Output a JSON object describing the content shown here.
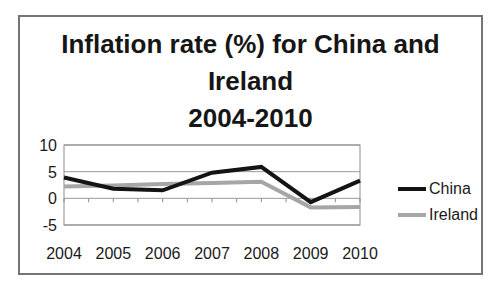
{
  "chart": {
    "title_lines": [
      "Inflation rate (%) for China and",
      "Ireland",
      "2004-2010"
    ]
  },
  "chart_data": {
    "type": "line",
    "title": "Inflation rate (%) for China and Ireland 2004-2010",
    "categories": [
      "2004",
      "2005",
      "2006",
      "2007",
      "2008",
      "2009",
      "2010"
    ],
    "series": [
      {
        "name": "China",
        "color": "#141414",
        "values": [
          3.9,
          1.8,
          1.5,
          4.8,
          5.9,
          -0.7,
          3.3
        ]
      },
      {
        "name": "Ireland",
        "color": "#a6a6a6",
        "values": [
          2.2,
          2.4,
          2.7,
          2.9,
          3.1,
          -1.7,
          -1.6
        ]
      }
    ],
    "xlabel": "",
    "ylabel": "",
    "ylim": [
      -5,
      10
    ],
    "yticks": [
      10,
      5,
      0,
      -5
    ],
    "grid": true,
    "legend_position": "right"
  },
  "colors": {
    "gridline": "#999999",
    "plot_border": "#8c8c8c",
    "frame_border": "#757575",
    "text": "#1a1a1a",
    "background": "#ffffff"
  }
}
